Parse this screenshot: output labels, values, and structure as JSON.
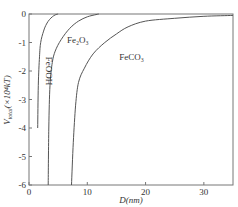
{
  "chart_data": {
    "type": "line",
    "title": "",
    "xlabel": "D(nm)",
    "ylabel": "V_total(×10⁴kT)",
    "ylabel_main": "V",
    "ylabel_sub": "total",
    "ylabel_rest": "(×10⁴kT)",
    "xlim": [
      0,
      35
    ],
    "ylim": [
      -6,
      0
    ],
    "xticks": [
      0,
      10,
      20,
      30
    ],
    "yticks": [
      0,
      -1,
      -2,
      -3,
      -4,
      -5,
      -6
    ],
    "xtick_labels": [
      "0",
      "10",
      "20",
      "30"
    ],
    "ytick_labels": [
      "0",
      "-1",
      "-2",
      "-3",
      "-4",
      "-5",
      "-6"
    ],
    "grid": false,
    "series": [
      {
        "name": "FeOOH",
        "label": "FeOOH",
        "x": [
          1.5,
          1.6,
          1.8,
          2.0,
          2.5,
          3.0,
          3.5,
          4.0,
          4.5,
          5.0
        ],
        "y": [
          -4.0,
          -2.5,
          -1.5,
          -1.0,
          -0.6,
          -0.35,
          -0.2,
          -0.1,
          -0.03,
          0.0
        ]
      },
      {
        "name": "Fe2O3",
        "label": "Fe₂O₃",
        "x": [
          3.3,
          3.4,
          3.6,
          4.0,
          4.5,
          5.5,
          7.0,
          8.5,
          10.0,
          11.5,
          12.0
        ],
        "y": [
          -6.0,
          -4.0,
          -2.5,
          -1.7,
          -1.3,
          -0.9,
          -0.5,
          -0.25,
          -0.1,
          -0.02,
          0.0
        ]
      },
      {
        "name": "FeCO3",
        "label": "FeCO₃",
        "x": [
          7.3,
          7.6,
          8.0,
          8.5,
          9.5,
          11.0,
          13.0,
          15.0,
          17.0,
          20.0,
          25.0,
          30.0,
          35.0
        ],
        "y": [
          -6.0,
          -4.5,
          -3.2,
          -2.4,
          -1.9,
          -1.4,
          -1.0,
          -0.7,
          -0.45,
          -0.25,
          -0.15,
          -0.08,
          -0.05
        ]
      }
    ],
    "annotations": [
      {
        "text": "FeOOH",
        "x": 3.0,
        "y": -2.0,
        "rotation": "vertical"
      },
      {
        "text": "Fe₂O₃",
        "x": 6.5,
        "y": -1.0
      },
      {
        "text": "FeCO₃",
        "x": 15.5,
        "y": -1.6
      }
    ]
  }
}
